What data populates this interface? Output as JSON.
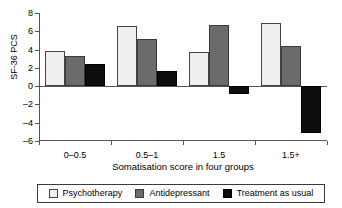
{
  "chart_data": {
    "type": "bar",
    "title": "",
    "xlabel": "Somatisation score in four groups",
    "ylabel": "SF-36 PCS",
    "categories": [
      "0–0.5",
      "0.5–1",
      "1.5",
      "1.5+"
    ],
    "series": [
      {
        "name": "Psychotherapy",
        "color": "#efefef",
        "values": [
          3.8,
          6.6,
          3.7,
          6.9
        ]
      },
      {
        "name": "Antidepressant",
        "color": "#6b6b6b",
        "values": [
          3.3,
          5.2,
          6.7,
          4.4
        ]
      },
      {
        "name": "Treatment as usual",
        "color": "#0d0d0d",
        "values": [
          2.4,
          1.7,
          -0.9,
          -5.1
        ]
      }
    ],
    "ylim": [
      -6,
      8
    ],
    "ytick_labels": [
      "8",
      "6",
      "4",
      "2",
      "0",
      "–2",
      "–4",
      "–6"
    ],
    "ytick_values": [
      8,
      6,
      4,
      2,
      0,
      -2,
      -4,
      -6
    ],
    "grid": false,
    "legend_position": "bottom",
    "zero_line": true
  },
  "axis": {
    "y_title": "SF-36 PCS",
    "x_title": "Somatisation score in four groups"
  },
  "legend": {
    "items": [
      {
        "label": "Psychotherapy"
      },
      {
        "label": "Antidepressant"
      },
      {
        "label": "Treatment as usual"
      }
    ]
  }
}
